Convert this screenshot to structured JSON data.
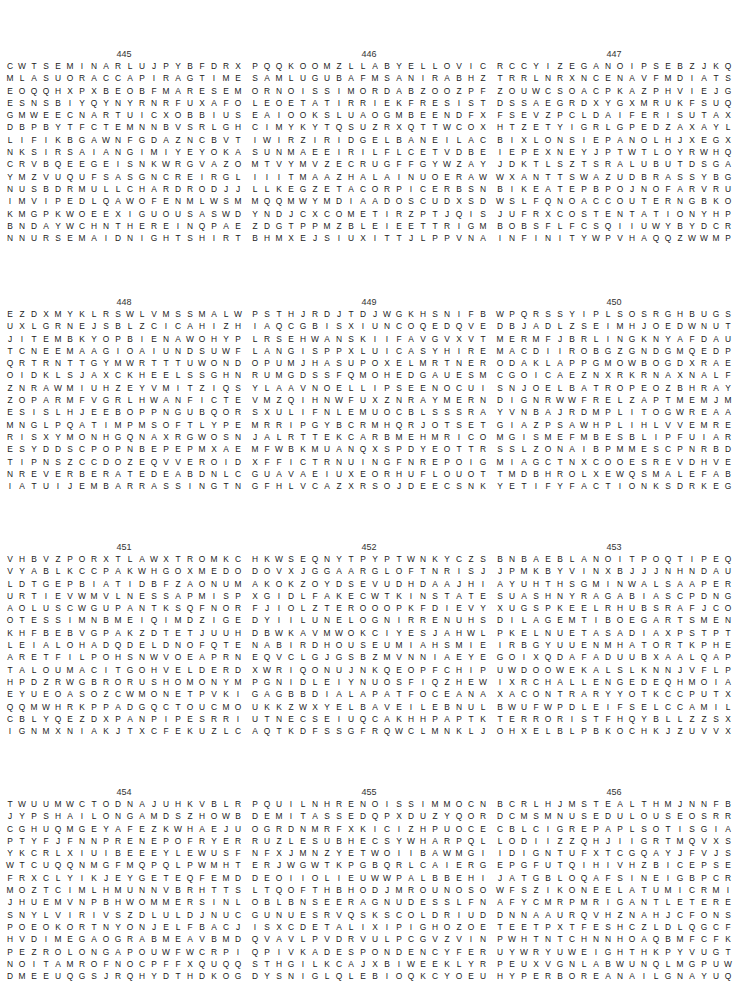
{
  "page": {
    "puzzles": [
      {
        "number": "445",
        "rows": [
          "CWTSEMINARLUJPYBFDRX",
          "MLASUORACCAPIRAGTIME",
          "EOQQHXPXBEOBFMARESEM",
          "ESNSBIYQYNYRNRFUXAFO",
          "GMWEECNARTUICXOBBIUS",
          "DBPBYTFCTEMNNBVSRLGH",
          "LIFIKBGAWNFGDAZNCBVT",
          "NKSIRSAIANGIMIYEYOKA",
          "CRVBQEEGEISNKWRGVAZO",
          "YMZVUQUFSASGNCREIRGL",
          "NUSBDRMULLCHARDRODJJ",
          "IMVIPEDLQAWOFENMLWSM",
          "KMGPKWOEEXIGUOUSASWD",
          "BNDAYWCHNTHEREINQPAE",
          "NNURSEMAIDNIGHTSHIRT"
        ]
      },
      {
        "number": "446",
        "rows": [
          "PQQKOOMZLLABYELLOVIC",
          "SAMLUGUBAFMSANIRABHZ",
          "ORNOISSIMORDABZOOZPF",
          "LEOETATIRRIEKFRESIST",
          "EAIOOKSLUAOGMBEENDFX",
          "CIMYKYTQSUZRXQTTWCOX",
          "IWIRZIRIDGELBANEILAC",
          "SUNMAEEIRILFLCETVDBE",
          "MTVYMVZECRUGFFGYWZAY",
          "IIITMAAZHALAINUOERAW",
          "LLKEGZETACORPICERBSN",
          "MQQMWYMDIAADOSCUDXSD",
          "YNDJCXCOMETIRZPTJQIS",
          "ZDGTPPMZBLEIEETTRIGM",
          "BHMXEJSIUXITTJLPPVNA"
        ]
      },
      {
        "number": "447",
        "rows": [
          "RCCYIZEGANOIPSEBZJKQ",
          "TRRLNRXNCENAVFMDIATS",
          "ZOUWCSOACPKAZPHVIEJG",
          "DSSAEGRDXYGXMRUKFSUQ",
          "FSEVZPCLDAIFERISUTAX",
          "HTZETYIGRLGPEDZAXAYL",
          "BIXLONSIEPANOLHJXEGX",
          "IEPEXNEYJPTWTLOYRWHQ",
          "JDKTLSZTSRALUBUTDSGA",
          "WXANTTSWAZUDBRASSYBG",
          "BIKEATEPBPOJNOFARVRU",
          "WSLFQNOACCOUTERNGBKO",
          "JUFRXCOSTENTATIONYHP",
          "BOBSFLFCSQIIUWYBYDCR",
          "INFINITYWPVHAQQZWWMP"
        ]
      },
      {
        "number": "448",
        "rows": [
          "EZDXMYKLRSWLVMSSMALW",
          "UXLGRNEJSBLZCICAHIZH",
          "JITEMBKYOPBIENAWOHYP",
          "TCNEEMAAGIOAIUNDSUWF",
          "QRTRNTTGYMWRTTTUWOND",
          "OIDKLSJAXCKHEELSSGHN",
          "ZNRAWMIUHZEYVMITZIQS",
          "ZOPARMFVGRLHWANFICTE",
          "ESISLHJEEBOPPNGUBQOR",
          "MNGLPQATIMPMSOFTLYPE",
          "RISXYMONHGQNAXRGWOSN",
          "ESYDDSCPOPNBEPEPMXAE",
          "TIPNSZCCDOZEQVVEROID",
          "NREVERBERATEDEABDNLC",
          "IATUIJEMBARRASSINGTN"
        ]
      },
      {
        "number": "449",
        "rows": [
          "PSTHJRDJTDJWGKHSNIFB",
          "IAQCGBISXIUNCOQEDQVE",
          "LRSEHWANSKIIFAVGVXVT",
          "LANGISPPXLUICASYHIRE",
          "OPUMJHASUPOXELMRTNER",
          "RUMGDSSFQMOHEDGAUESM",
          "YLAAVNOELLIPSEENOCUI",
          "VMZQIHNWFUXZNRAYMERN",
          "SXULIFNLEMUOCBLSSSRA",
          "MRRIPGYBCRMHQRJOTSET",
          "JALRTTEKCARBMEHMRICO",
          "MFWBKMUANQXSPDYEOTTR",
          "XFFICTRNUINGFNREPOIG",
          "GUAVAEIUXEORHUFLOUOT",
          "GFHLVCAZXRSOJDEECSNK"
        ]
      },
      {
        "number": "450",
        "rows": [
          "WPQRSSYIPLSOSRGHBUGS",
          "DBJADLZSEIMHJOEDWNUT",
          "MERMFJBRLINGKNYAFDAU",
          "MACDIIROBGZGNDGMQEDP",
          "ODAKLAPPGMOWBOGDXRAE",
          "CGOICAEZNXRKRNAXNALF",
          "SNJOELBATROPEOZBHRAY",
          "DIGNRWWFRELZAPTMEMJM",
          "YVNBAJRDMPLITOGWREAA",
          "GIAZPSAWHPLIHLVVEMRE",
          "MGISMEFMBESBLIPFUIAR",
          "SSLZONAIBPMMESCPNRBD",
          "MIAGCTNXCOOESREVDHVE",
          "TMDBHROLXEWQSMALEFAB",
          "YETIFYFACTIONKSDRKEG"
        ]
      },
      {
        "number": "451",
        "rows": [
          "VHBVZPORXTLAWXTROMKC",
          "VYABLKCCPAKWHGOXMEDO",
          "LDTGEPBIATIDBFZAONUM",
          "URTIEVWMVLNESSAPMISP",
          "AOLUSCWGUPANTKSQFNOR",
          "OTESSIMNBMEIQIMDZIGE",
          "KHFBEBVGPAKZDTETJUUH",
          "LEIALOHADQDELDNOFQTE",
          "ARETFILPOHSNWVOEAPRN",
          "TALOUMACITGOHVELDERD",
          "HPDZRWGBRORUSHOMONYM",
          "EYUEOASOZCWMONETPVKI",
          "QQMWHRKPPADGQCTOUCMO",
          "CBLYQEZDXPANPIPESRRI",
          "IGNMXNIAKJTXCFEKUZLC"
        ]
      },
      {
        "number": "452",
        "rows": [
          "HKWSEQNYTPYPTWNKYCZS",
          "DOVXJGGAARGLOFTNRISJ",
          "AKOKZOYDSEVUDHDAAJHI",
          "XGIDLFAKECWTKINSTATE",
          "FJIOLZTEROOOPKFDIEVY",
          "DYIILUNELOGNIRRENUHS",
          "DBWKAVMWOKCIYESJAHWL",
          "NABIRDHOUSEUMIAHSMIE",
          "EQVCLGJGSBZMVNNIAEYE",
          "XWRIQONUJNKQEOPFCHIP",
          "PGNIDLEIYNUOSFIQZHEW",
          "GAGBBDIALAPATFOCEANA",
          "UKKZWXYELBAVEILEBNUL",
          "UTNECSEIUQCAKHHPAPTK",
          "AQTKDFSSGFRQWCLMNKLJ"
        ]
      },
      {
        "number": "453",
        "rows": [
          "BNBAEBLANOITPOQTIPEQ",
          "JPMKBYVINXBJJJNHNDAU",
          "AYUHTHSGMINWALSAAPER",
          "SUASHNYRAGABIASCPDNG",
          "XUGSPKEELRHUBSRAFJCO",
          "DILAGEMTIBOEGARTSMEN",
          "PKELNUETASADIAXPSTPT",
          "IRBGYUUENMHATORTKPHE",
          "GOIXQDAFADUUBXAALQAP",
          "UWDOOWEKALSLKNNJVFLP",
          "IXRCHALLENGEDEQHMOIA",
          "XACONTRARYYOTKCCPUTX",
          "BWUFWPDLEIFSELCCAMIL",
          "TERRORISTFHQYBLLZZSX",
          "OHXELBLPBKOCHKJZUVVX"
        ]
      },
      {
        "number": "454",
        "rows": [
          "TWUUMWCTODNAJUHKVBLR",
          "JYPSHAILONGAMDSZHOWB",
          "CGHUQMGEYAFEZKWHAEJU",
          "PTYFJFNNPRENEPOFRYER",
          "YKCRLXIUIBEEEYLEWUSF",
          "WTCUQQNMGFMQPQLPWMHT",
          "FRXCLYIKJEYGETEQFEMD",
          "MOZTCIMLHMUNNVBRHTTS",
          "JHUEMVNPBHWOMMERSINL",
          "SNYLVIRIVSZDLULDJNUC",
          "POEOKORTNYONJELFBACJ",
          "HVDIMEGAOGRABMEAVBMD",
          "PEZROLONGAPOUWFWCRPI",
          "NOITAMROFNOCPFFXQUQQ",
          "DMEEUQGSJRQHYDTHDKOG"
        ]
      },
      {
        "number": "455",
        "rows": [
          "PQUILNHRENOISSIMMOCN",
          "DEMITASSEDQPXDUZYQOR",
          "OGRDNMRFXKICIZHPUOCE",
          "RUZLESUBHECSYWHARPQL",
          "NFXJMNZYETWOIIBAWMGI",
          "ERJWGWTKPGBQRLCAIERG",
          "DEOIIOLIEUWWPALBBEHI",
          "LTQOFTHBHODJMROUNOSO",
          "OBLBNSEERAGNUDESSLFN",
          "GUNUESRVQSKSCOLDRIUD",
          "ISXCDETALIXIPIGHOZOE",
          "QVAVLPVDRVULPCGVZVIN",
          "QPIVKADESPONDENCYFER",
          "STHGILKCAJXBIWEEKLYR",
          "DYSNIGLQLEBIOQKCYOEU"
        ]
      },
      {
        "number": "456",
        "rows": [
          "BCRLHJMSTEALTHMJNNFB",
          "DCMSMNUSEDULOUSEOSRR",
          "CBLCIGREPAPLSOTISGIA",
          "LODIIZZQHJIIGRTMQVXS",
          "IDIGNTUFXTCGQAYJFVJS",
          "EPGFUTQIHIVHZBICEPSE",
          "JATGBLOQAFSINEIGBPCR",
          "WFSZIKONEELATUMICRMI",
          "AFYCMRPMRIGANTLETERE",
          "DNNAAURQVHZNAHJCFONS",
          "TEETPXTFESHCZLDLQGCF",
          "PWHTNTCHNNHOAQBMFCFK",
          "UYWRYUWEIGHTHKPYVUGT",
          "PEUXVGNLABWUNQLMGPUW",
          "HYPERBOREANAILGNAYUQ"
        ]
      }
    ]
  }
}
